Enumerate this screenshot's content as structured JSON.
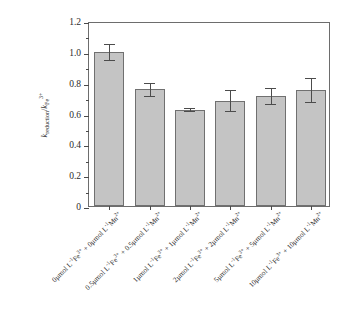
{
  "chart_data": {
    "type": "bar",
    "title": "",
    "subtitle": "",
    "xlabel": "",
    "ylabel": "k_reduction / k_Fe3+",
    "ylabel_parts": {
      "k": "k",
      "sub": "reduction",
      "slash": "/",
      "k2": "k",
      "sub2": "Fe",
      "sup2": "3+"
    },
    "ylim": [
      0,
      1.2
    ],
    "yticks": [
      0,
      0.2,
      0.4,
      0.6,
      0.8,
      1.0,
      1.2
    ],
    "ytick_labels": [
      "0",
      "0.2",
      "0.4",
      "0.6",
      "0.8",
      "1.0",
      "1.2"
    ],
    "minor_ticks": true,
    "grid": false,
    "legend": "none",
    "bar_color": "#c4c4c4",
    "bar_edge_color": "#707070",
    "error_color": "#4c4c4c",
    "axis_color": "#6d6d6d",
    "categories": [
      "0μmol L⁻¹Fe³⁺ + 0μmol L⁻¹Mn²⁺",
      "0.5μmol L⁻¹Fe³⁺ + 0.5μmol L⁻¹Mn²⁺",
      "1μmol L⁻¹Fe³⁺ + 1μmol L⁻¹Mn²⁺",
      "2μmol L⁻¹Fe³⁺ + 2μmol L⁻¹Mn²⁺",
      "5μmol L⁻¹Fe³⁺ + 5μmol L⁻¹Mn²⁺",
      "10μmol L⁻¹Fe³⁺ + 10μmol L⁻¹Mn²⁺"
    ],
    "category_parts": [
      {
        "fe_conc": "0μmol L",
        "fe_sup": "-1",
        "fe_ion": "Fe",
        "fe_chg": "3+",
        "mn_conc": "0μmol L",
        "mn_sup": "-1",
        "mn_ion": "Mn",
        "mn_chg": "2+"
      },
      {
        "fe_conc": "0.5μmol L",
        "fe_sup": "-1",
        "fe_ion": "Fe",
        "fe_chg": "3+",
        "mn_conc": "0.5μmol L",
        "mn_sup": "-1",
        "mn_ion": "Mn",
        "mn_chg": "2+"
      },
      {
        "fe_conc": "1μmol L",
        "fe_sup": "-1",
        "fe_ion": "Fe",
        "fe_chg": "3+",
        "mn_conc": "1μmol L",
        "mn_sup": "-1",
        "mn_ion": "Mn",
        "mn_chg": "2+"
      },
      {
        "fe_conc": "2μmol L",
        "fe_sup": "-1",
        "fe_ion": "Fe",
        "fe_chg": "3+",
        "mn_conc": "2μmol L",
        "mn_sup": "-1",
        "mn_ion": "Mn",
        "mn_chg": "2+"
      },
      {
        "fe_conc": "5μmol L",
        "fe_sup": "-1",
        "fe_ion": "Fe",
        "fe_chg": "3+",
        "mn_conc": "5μmol L",
        "mn_sup": "-1",
        "mn_ion": "Mn",
        "mn_chg": "2+"
      },
      {
        "fe_conc": "10μmol L",
        "fe_sup": "-1",
        "fe_ion": "Fe",
        "fe_chg": "3+",
        "mn_conc": "10μmol L",
        "mn_sup": "-1",
        "mn_ion": "Mn",
        "mn_chg": "2+"
      }
    ],
    "values": [
      0.998,
      0.757,
      0.624,
      0.684,
      0.713,
      0.753
    ],
    "errors": [
      0.052,
      0.042,
      0.01,
      0.07,
      0.052,
      0.08
    ]
  }
}
